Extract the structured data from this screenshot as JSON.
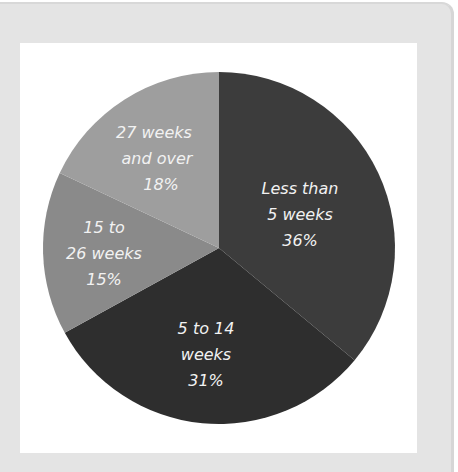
{
  "chart_data": {
    "type": "pie",
    "title": "",
    "categories": [
      "Less than 5 weeks",
      "5 to 14 weeks",
      "15 to 26 weeks",
      "27 weeks and over"
    ],
    "values": [
      36,
      31,
      15,
      18
    ],
    "unit": "%",
    "start_angle_deg": 0,
    "direction": "clockwise",
    "colors": [
      "#3c3c3c",
      "#2e2e2e",
      "#8a8a8a",
      "#9e9e9e"
    ],
    "legend": "none (labels inside slices)",
    "slices": [
      {
        "label_lines": [
          "Less than",
          "5 weeks",
          "36%"
        ],
        "value": 36,
        "color": "#3c3c3c"
      },
      {
        "label_lines": [
          "5 to 14",
          "weeks",
          "31%"
        ],
        "value": 31,
        "color": "#2e2e2e"
      },
      {
        "label_lines": [
          "15 to",
          "26 weeks",
          "15%"
        ],
        "value": 15,
        "color": "#8a8a8a"
      },
      {
        "label_lines": [
          "27 weeks",
          "and over",
          "18%"
        ],
        "value": 18,
        "color": "#9e9e9e"
      }
    ]
  }
}
